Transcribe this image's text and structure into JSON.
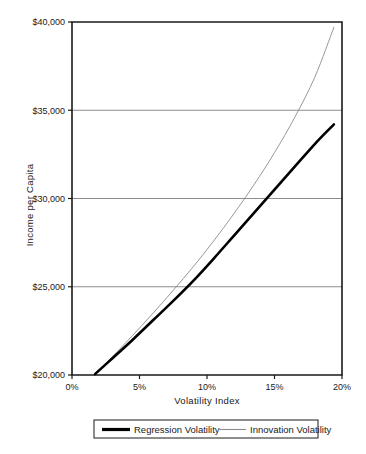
{
  "chart_data": {
    "type": "line",
    "title": "",
    "xlabel": "Volatility Index",
    "ylabel": "Income per Capita",
    "xlim": [
      0,
      20
    ],
    "ylim": [
      20000,
      40000
    ],
    "xticks": [
      "0%",
      "5%",
      "10%",
      "15%",
      "20%"
    ],
    "xtick_values": [
      0,
      5,
      10,
      15,
      20
    ],
    "yticks": [
      "$20,000",
      "$25,000",
      "$30,000",
      "$35,000",
      "$40,000"
    ],
    "ytick_values": [
      20000,
      25000,
      30000,
      35000,
      40000
    ],
    "grid": "horizontal",
    "legend_position": "bottom",
    "series": [
      {
        "name": "Regression Volatility",
        "color": "#000000",
        "line_width": 2.6,
        "x": [
          1.7,
          3.0,
          4.5,
          6.0,
          7.5,
          9.0,
          10.5,
          12.0,
          13.5,
          15.0,
          16.5,
          18.0,
          19.4
        ],
        "values": [
          20050,
          20950,
          22000,
          23100,
          24200,
          25350,
          26600,
          27900,
          29200,
          30500,
          31800,
          33100,
          34200
        ]
      },
      {
        "name": "Innovation Volatility",
        "color": "#8c8c8c",
        "line_width": 0.9,
        "x": [
          1.7,
          3.0,
          4.5,
          6.0,
          7.5,
          9.0,
          10.5,
          12.0,
          13.5,
          15.0,
          16.5,
          18.0,
          19.4
        ],
        "values": [
          20050,
          21050,
          22250,
          23500,
          24800,
          26150,
          27600,
          29150,
          30800,
          32600,
          34600,
          36900,
          39700
        ]
      }
    ]
  },
  "legend": {
    "items": [
      {
        "label": "Regression Volatility",
        "swatch": "thick-black-line"
      },
      {
        "label": "Innovation Volatility",
        "swatch": "thin-gray-line"
      }
    ]
  },
  "colors": {
    "axis": "#1a1a1a",
    "gridline": "#8c8c8c",
    "series_primary": "#000000",
    "series_secondary": "#8c8c8c",
    "background": "#ffffff"
  }
}
